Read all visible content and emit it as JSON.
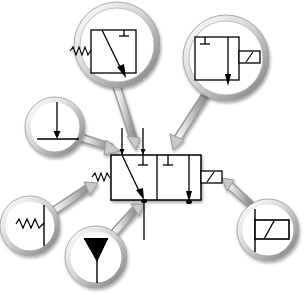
{
  "diagram": {
    "title": "3/2-way solenoid valve symbol with magnified components",
    "central_symbol": "3/2 directional control valve, spring return, solenoid actuated",
    "callouts": [
      {
        "id": "valve-spring-position",
        "label": "Spring-return position (left box with flow arrow and blocked port)"
      },
      {
        "id": "valve-solenoid-position",
        "label": "Actuated position (right box with flow arrow, blocked port and solenoid)"
      },
      {
        "id": "pressure-port",
        "label": "Port with flow arrow"
      },
      {
        "id": "spring-return",
        "label": "Spring return"
      },
      {
        "id": "exhaust-port",
        "label": "Exhaust"
      },
      {
        "id": "solenoid",
        "label": "Solenoid actuator"
      }
    ]
  },
  "colors": {
    "background": "#ffffff",
    "line": "#000000",
    "ring_light": "#f2f2f2",
    "ring_mid": "#c8c8c8",
    "ring_dark": "#8a8a8a"
  }
}
